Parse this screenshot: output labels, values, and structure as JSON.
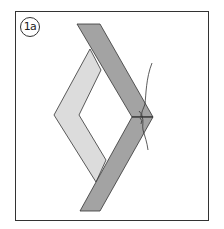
{
  "diagram": {
    "step_label": "1a",
    "colors": {
      "dark_strip": "#a3a3a3",
      "light_strip": "#dcdcdc",
      "outline": "#333333",
      "frame": "#333333",
      "background": "#ffffff"
    }
  }
}
